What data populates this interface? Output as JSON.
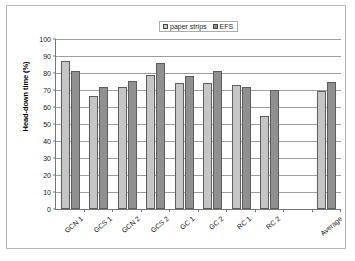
{
  "chart_data": {
    "type": "bar",
    "title": "",
    "xlabel": "",
    "ylabel": "Head-down time (%)",
    "ylim": [
      0,
      100
    ],
    "yticks": [
      0,
      10,
      20,
      30,
      40,
      50,
      60,
      70,
      80,
      90,
      100
    ],
    "grid": true,
    "legend_position": "top-center",
    "categories": [
      "GCN 1",
      "GCS 1",
      "GCN 2",
      "GCS 2",
      "GC 1",
      "GC 2",
      "RC 1",
      "RC 2",
      "",
      "Average"
    ],
    "series": [
      {
        "name": "paper strips",
        "color": "#c6c6c6",
        "values": [
          87,
          66.5,
          71.5,
          79,
          74,
          74,
          73,
          55,
          null,
          69.5
        ]
      },
      {
        "name": "EFS",
        "color": "#909090",
        "values": [
          81,
          72,
          75.5,
          86,
          78,
          81,
          71.5,
          70,
          null,
          74.5
        ]
      }
    ]
  },
  "legend": {
    "items": [
      {
        "label": "paper strips"
      },
      {
        "label": "EFS"
      }
    ]
  },
  "axis": {
    "y_title": "Head-down time (%)",
    "y_tick_labels": [
      "100",
      "90",
      "80",
      "70",
      "60",
      "50",
      "40",
      "30",
      "20",
      "10",
      "0"
    ]
  }
}
